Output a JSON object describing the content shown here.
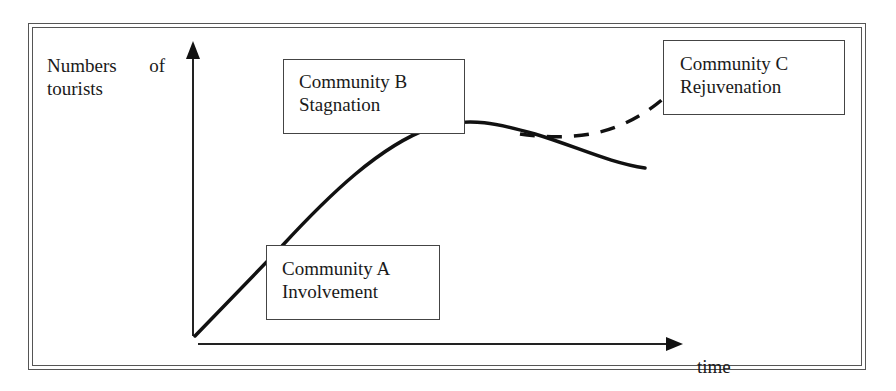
{
  "diagram": {
    "y_axis_label_line1_word1": "Numbers",
    "y_axis_label_line1_word2": "of",
    "y_axis_label_line2": "tourists",
    "x_axis_label": "time",
    "stages": [
      {
        "community": "Community A",
        "stage": "Involvement"
      },
      {
        "community": "Community B",
        "stage": "Stagnation"
      },
      {
        "community": "Community C",
        "stage": "Rejuvenation"
      }
    ],
    "curves": {
      "main": "solid line: rising, peaking at stagnation, then declining",
      "rejuvenation": "dashed line: branching upward after the peak"
    },
    "colors": {
      "line": "#111111",
      "frame": "#555555",
      "background": "#ffffff"
    }
  }
}
